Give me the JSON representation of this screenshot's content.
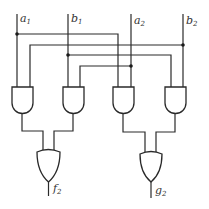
{
  "diagram": {
    "type": "logic-circuit",
    "inputs": [
      {
        "name": "a",
        "sub": "1",
        "x": 17
      },
      {
        "name": "b",
        "sub": "1",
        "x": 68
      },
      {
        "name": "a",
        "sub": "2",
        "x": 131
      },
      {
        "name": "b",
        "sub": "2",
        "x": 183
      }
    ],
    "outputs": [
      {
        "name": "f",
        "sub": "2"
      },
      {
        "name": "g",
        "sub": "2"
      }
    ],
    "gates": {
      "and_count": 4,
      "or_count": 2
    },
    "colors": {
      "line": "#2a2a2a",
      "background": "#ffffff"
    }
  }
}
